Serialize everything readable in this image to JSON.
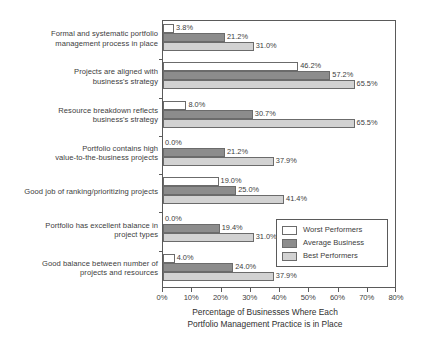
{
  "chart_data": {
    "type": "bar",
    "orientation": "horizontal",
    "title": "",
    "xlabel": "Percentage of Businesses Where Each Portfolio Management Practice is in Place",
    "xlabel_lines": [
      "Percentage of Businesses Where Each",
      "Portfolio Management Practice is in Place"
    ],
    "ylabel": "",
    "xlim": [
      0,
      80
    ],
    "xticks": [
      0,
      10,
      20,
      30,
      40,
      50,
      60,
      70,
      80
    ],
    "xtick_labels": [
      "0%",
      "10%",
      "20%",
      "30%",
      "40%",
      "50%",
      "60%",
      "70%",
      "80%"
    ],
    "grid": false,
    "legend_position": "inside-right-lower",
    "categories": [
      "Formal and systematic portfolio management process in place",
      "Projects are aligned with business's strategy",
      "Resource breakdown reflects business's strategy",
      "Portfolio contains high value-to-the-business projects",
      "Good job of ranking/prioritizing projects",
      "Portfolio has excellent balance in project types",
      "Good balance between number of projects and resources"
    ],
    "category_lines": [
      [
        "Formal and systematic portfolio",
        "management process in place"
      ],
      [
        "Projects are aligned with",
        "business's strategy"
      ],
      [
        "Resource breakdown reflects",
        "business's strategy"
      ],
      [
        "Portfolio contains high",
        "value-to-the-business projects"
      ],
      [
        "Good job of ranking/prioritizing projects"
      ],
      [
        "Portfolio has excellent balance in",
        "project types"
      ],
      [
        "Good balance between number of",
        "projects and resources"
      ]
    ],
    "series": [
      {
        "name": "Worst Performers",
        "color": "#ffffff",
        "values": [
          3.8,
          46.2,
          8.0,
          0.0,
          19.0,
          0.0,
          4.0
        ],
        "labels": [
          "3.8%",
          "46.2%",
          "8.0%",
          "0.0%",
          "19.0%",
          "0.0%",
          "4.0%"
        ]
      },
      {
        "name": "Average Business",
        "color": "#8c8c8c",
        "values": [
          21.2,
          57.2,
          30.7,
          21.2,
          25.0,
          19.4,
          24.0
        ],
        "labels": [
          "21.2%",
          "57.2%",
          "30.7%",
          "21.2%",
          "25.0%",
          "19.4%",
          "24.0%"
        ]
      },
      {
        "name": "Best Performers",
        "color": "#d2d2d2",
        "values": [
          31.0,
          65.5,
          65.5,
          37.9,
          41.4,
          31.0,
          37.9
        ],
        "labels": [
          "31.0%",
          "65.5%",
          "65.5%",
          "37.9%",
          "41.4%",
          "31.0%",
          "37.9%"
        ]
      }
    ]
  },
  "legend": {
    "items": [
      {
        "label": "Worst Performers",
        "color": "#ffffff"
      },
      {
        "label": "Average Business",
        "color": "#8c8c8c"
      },
      {
        "label": "Best Performers",
        "color": "#d2d2d2"
      }
    ]
  }
}
